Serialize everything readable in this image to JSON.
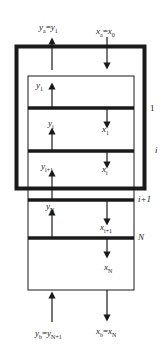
{
  "diagram": {
    "title": "",
    "top_labels": {
      "vapor_out": {
        "base": "y",
        "sub": "a",
        "eq": "=",
        "base2": "y",
        "sub2": "1"
      },
      "liquid_in": {
        "base": "x",
        "sub": "a",
        "eq": "=",
        "base2": "x",
        "sub2": "0"
      }
    },
    "bottom_labels": {
      "vapor_in": {
        "base": "y",
        "sub": "b",
        "eq": "=",
        "base2": "y",
        "sub2": "N+1"
      },
      "liquid_out": {
        "base": "x",
        "sub": "b",
        "eq": "=",
        "base2": "x",
        "sub2": "N"
      }
    },
    "stream_labels": [
      {
        "id": "y1",
        "base": "y",
        "sub": "1"
      },
      {
        "id": "x1",
        "base": "x",
        "sub": "1"
      },
      {
        "id": "yi",
        "base": "y",
        "sub": "i"
      },
      {
        "id": "xi",
        "base": "x",
        "sub": "i"
      },
      {
        "id": "yi1",
        "base": "y",
        "sub": "i+1"
      },
      {
        "id": "xi1",
        "base": "x",
        "sub": "i+1"
      },
      {
        "id": "yN",
        "base": "y",
        "sub": "N"
      },
      {
        "id": "xN",
        "base": "x",
        "sub": "N"
      }
    ],
    "stage_labels": {
      "stage_1": "1",
      "stage_i": "i",
      "stage_i1": "i+1",
      "stage_N": "N"
    },
    "colors": {
      "line": "#1a1a1a",
      "background": "#ffffff"
    }
  }
}
